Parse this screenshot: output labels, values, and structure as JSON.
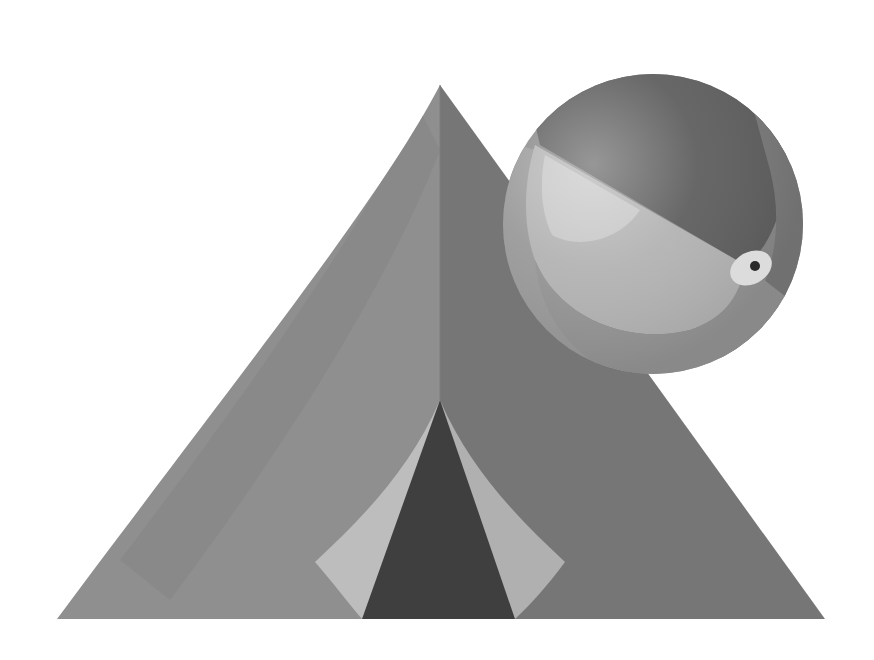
{
  "scene": {
    "title": "Tent and beach ball illustration",
    "background": "#ffffff",
    "palette": {
      "tent_left": "#8f8f8f",
      "tent_left_band": "#858585",
      "tent_right": "#767676",
      "door_dark": "#3f3f3f",
      "door_flap": "#bdbdbd",
      "ball_dark": "#5f5f5f",
      "ball_mid": "#8a8a8a",
      "ball_light": "#b3b3b3",
      "ball_highlight": "#d6d6d6",
      "ball_rim": "#9a9a9a",
      "valve_ring": "#dcdcdc",
      "valve_hole": "#2a2a2a"
    },
    "objects": [
      {
        "name": "tent",
        "apex": [
          440,
          85
        ],
        "base_left": [
          57,
          619
        ],
        "base_right": [
          825,
          619
        ]
      },
      {
        "name": "tent-door",
        "apex": [
          440,
          400
        ],
        "base_left": [
          362,
          619
        ],
        "base_right": [
          515,
          619
        ]
      },
      {
        "name": "beach-ball",
        "center": [
          653,
          224
        ],
        "radius": 150
      },
      {
        "name": "ball-valve",
        "center": [
          751,
          268
        ]
      }
    ]
  }
}
